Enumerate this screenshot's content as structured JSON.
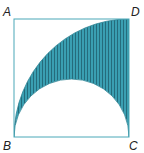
{
  "diagram": {
    "labels": {
      "A": "A",
      "B": "B",
      "C": "C",
      "D": "D"
    },
    "colors": {
      "stroke": "#4aa8b8",
      "fill": "#3a9fb2",
      "hatch": "#1f5f6e",
      "text": "#222222"
    }
  }
}
